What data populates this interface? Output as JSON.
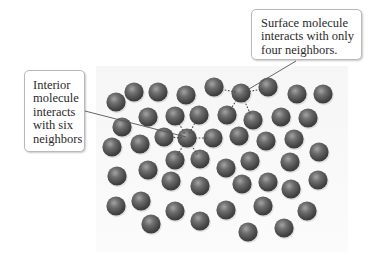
{
  "figure": {
    "colors": {
      "background": "#ffffff",
      "panel": "#f7f7f7",
      "molecule_dark": "#3e3e3e",
      "molecule_mid": "#6a6a6a",
      "molecule_light": "#9a9a9a",
      "bond_dash": "#4a4a4a",
      "leader_line": "#555555",
      "callout_border": "#b9b9b9"
    },
    "molecule_radius": 9.6
  },
  "callouts": {
    "interior": {
      "lines": [
        "Interior",
        "molecule",
        "interacts",
        "with six",
        "neighbors"
      ],
      "leader": {
        "x1": 85,
        "y1": 111,
        "x2": 186,
        "y2": 137
      }
    },
    "surface": {
      "lines": [
        "Surface molecule",
        "interacts with only",
        "four neighbors."
      ],
      "leader": {
        "x1": 296,
        "y1": 61,
        "x2": 244,
        "y2": 92
      }
    }
  },
  "highlighted": {
    "interior_molecule": {
      "x": 187,
      "y": 138
    },
    "surface_molecule": {
      "x": 241,
      "y": 93
    }
  },
  "bonds": {
    "interior": [
      {
        "x1": 187,
        "y1": 138,
        "x2": 164,
        "y2": 137
      },
      {
        "x1": 187,
        "y1": 138,
        "x2": 213,
        "y2": 138
      },
      {
        "x1": 187,
        "y1": 138,
        "x2": 175,
        "y2": 116
      },
      {
        "x1": 187,
        "y1": 138,
        "x2": 199,
        "y2": 115
      },
      {
        "x1": 187,
        "y1": 138,
        "x2": 175,
        "y2": 160
      },
      {
        "x1": 187,
        "y1": 138,
        "x2": 200,
        "y2": 159
      }
    ],
    "surface": [
      {
        "x1": 241,
        "y1": 93,
        "x2": 214,
        "y2": 88
      },
      {
        "x1": 241,
        "y1": 93,
        "x2": 268,
        "y2": 88
      },
      {
        "x1": 241,
        "y1": 93,
        "x2": 227,
        "y2": 115
      },
      {
        "x1": 241,
        "y1": 93,
        "x2": 253,
        "y2": 120
      }
    ]
  },
  "molecules": [
    {
      "x": 116,
      "y": 102
    },
    {
      "x": 134,
      "y": 92
    },
    {
      "x": 158,
      "y": 92
    },
    {
      "x": 186,
      "y": 95
    },
    {
      "x": 214,
      "y": 87
    },
    {
      "x": 241,
      "y": 93
    },
    {
      "x": 268,
      "y": 87
    },
    {
      "x": 297,
      "y": 94
    },
    {
      "x": 323,
      "y": 94
    },
    {
      "x": 148,
      "y": 117
    },
    {
      "x": 175,
      "y": 116
    },
    {
      "x": 199,
      "y": 115
    },
    {
      "x": 227,
      "y": 115
    },
    {
      "x": 253,
      "y": 120
    },
    {
      "x": 281,
      "y": 117
    },
    {
      "x": 308,
      "y": 118
    },
    {
      "x": 122,
      "y": 127
    },
    {
      "x": 112,
      "y": 147
    },
    {
      "x": 140,
      "y": 144
    },
    {
      "x": 164,
      "y": 137
    },
    {
      "x": 187,
      "y": 138
    },
    {
      "x": 213,
      "y": 138
    },
    {
      "x": 239,
      "y": 136
    },
    {
      "x": 266,
      "y": 141
    },
    {
      "x": 294,
      "y": 139
    },
    {
      "x": 319,
      "y": 152
    },
    {
      "x": 117,
      "y": 176
    },
    {
      "x": 148,
      "y": 170
    },
    {
      "x": 175,
      "y": 160
    },
    {
      "x": 200,
      "y": 159
    },
    {
      "x": 226,
      "y": 168
    },
    {
      "x": 250,
      "y": 161
    },
    {
      "x": 290,
      "y": 162
    },
    {
      "x": 171,
      "y": 181
    },
    {
      "x": 200,
      "y": 186
    },
    {
      "x": 242,
      "y": 184
    },
    {
      "x": 268,
      "y": 182
    },
    {
      "x": 291,
      "y": 189
    },
    {
      "x": 318,
      "y": 180
    },
    {
      "x": 116,
      "y": 206
    },
    {
      "x": 141,
      "y": 201
    },
    {
      "x": 175,
      "y": 211
    },
    {
      "x": 226,
      "y": 210
    },
    {
      "x": 263,
      "y": 206
    },
    {
      "x": 307,
      "y": 211
    },
    {
      "x": 151,
      "y": 224
    },
    {
      "x": 200,
      "y": 221
    },
    {
      "x": 248,
      "y": 232
    },
    {
      "x": 284,
      "y": 228
    }
  ]
}
